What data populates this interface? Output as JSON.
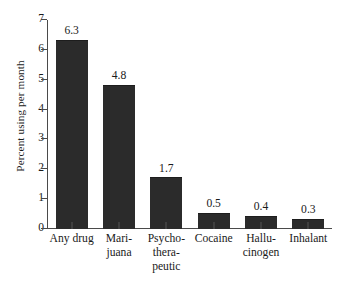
{
  "chart_data": {
    "type": "bar",
    "title": "",
    "subtitle": "",
    "xlabel": "",
    "ylabel": "Percent using per month",
    "categories": [
      "Any drug",
      "Mari-\njuana",
      "Psycho-\nthera-\npeutic",
      "Cocaine",
      "Hallu-\ncinogen",
      "Inhalant"
    ],
    "values": [
      6.3,
      4.8,
      1.7,
      0.5,
      0.4,
      0.3
    ],
    "value_labels": [
      "6.3",
      "4.8",
      "1.7",
      "0.5",
      "0.4",
      "0.3"
    ],
    "ylim": [
      0,
      7
    ],
    "y_ticks": [
      0,
      1,
      2,
      3,
      4,
      5,
      6,
      7
    ],
    "y_tick_labels": [
      "0",
      "1",
      "2",
      "3",
      "4",
      "5",
      "6",
      "7"
    ],
    "grid": false,
    "legend": "none",
    "bar_color": "#2b2b2b",
    "axis_color": "#4a4a4a",
    "background_color": "#ffffff",
    "text_color": "#1a1a1a"
  }
}
